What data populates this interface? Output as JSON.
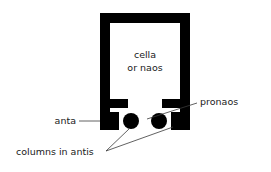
{
  "figure": {
    "background_color": "#ffffff",
    "ink_color": "#000000",
    "leader_color": "#3a3a3a",
    "text_color": "#1a1a1a"
  },
  "labels": {
    "cella_line1": "cella",
    "cella_line2": "or naos",
    "anta": "anta",
    "pronaos": "pronaos",
    "columns_in_antis": "columns in antis"
  },
  "structure": {
    "wall_thickness": 10,
    "outer_left": 100,
    "outer_right": 190,
    "outer_top": 13,
    "wall_bottom": 130,
    "anta_width": 18,
    "column_radius": 8,
    "column_left_cx": 131,
    "column_right_cx": 159,
    "column_cy": 121
  }
}
